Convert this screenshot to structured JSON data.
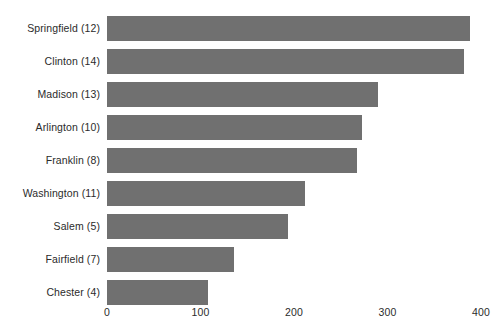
{
  "chart_data": {
    "type": "bar",
    "orientation": "horizontal",
    "title": "",
    "subtitle": "",
    "xlabel": "",
    "ylabel": "",
    "categories": [
      "Springfield (12)",
      "Clinton (14)",
      "Madison (13)",
      "Arlington (10)",
      "Franklin (8)",
      "Washington (11)",
      "Salem (5)",
      "Fairfield (7)",
      "Chester (4)"
    ],
    "values": [
      388,
      382,
      290,
      273,
      267,
      212,
      194,
      136,
      108
    ],
    "xlim": [
      0,
      400
    ],
    "xticks": [
      0,
      100,
      200,
      300,
      400
    ],
    "xtick_labels": [
      "0",
      "100",
      "200",
      "300",
      "400"
    ],
    "grid": false,
    "legend": null,
    "bar_color": "#707070",
    "background_color": "#ffffff",
    "text_color": "#2b2b2b",
    "annotations": []
  }
}
